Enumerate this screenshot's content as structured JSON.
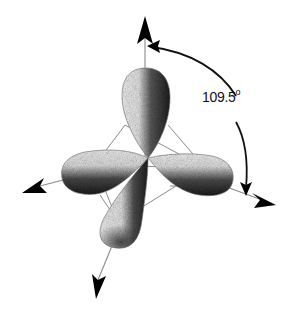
{
  "diagram": {
    "angle_label": {
      "value": "109.5",
      "unit": "°"
    },
    "lobes": [
      {
        "name": "top",
        "direction": "up"
      },
      {
        "name": "left",
        "direction": "left-down"
      },
      {
        "name": "right",
        "direction": "right-down"
      },
      {
        "name": "bottom",
        "direction": "down"
      }
    ],
    "axes": [
      {
        "name": "up-axis",
        "arrow": "top"
      },
      {
        "name": "left-axis",
        "arrow": "left"
      },
      {
        "name": "right-axis",
        "arrow": "right"
      },
      {
        "name": "down-axis",
        "arrow": "bottom"
      }
    ],
    "colors": {
      "background": "#ffffff",
      "lobe_light": "#e6e6e6",
      "lobe_dark": "#2a2a2a",
      "axis_line": "#8a8a8a",
      "arrow": "#000000"
    }
  }
}
